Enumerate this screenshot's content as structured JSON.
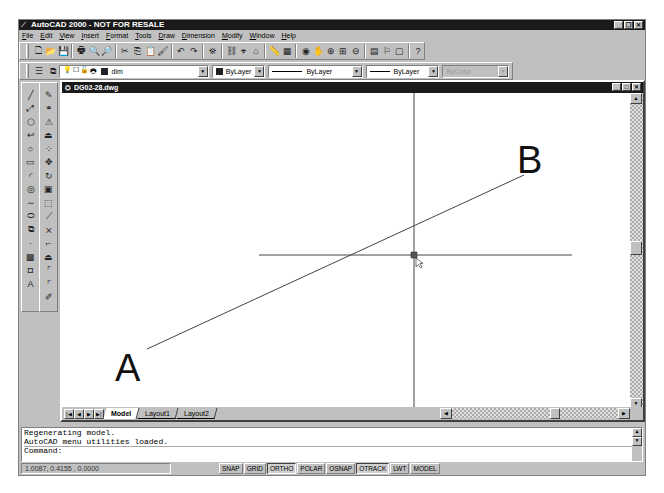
{
  "window": {
    "title": "AutoCAD 2000 - NOT FOR RESALE",
    "controls": [
      "minimize",
      "restore",
      "close"
    ]
  },
  "menubar": {
    "items": [
      "File",
      "Edit",
      "View",
      "Insert",
      "Format",
      "Tools",
      "Draw",
      "Dimension",
      "Modify",
      "Window",
      "Help"
    ]
  },
  "standard_toolbar": {
    "icons": [
      "new-icon",
      "open-icon",
      "save-icon",
      "print-icon",
      "print-preview-icon",
      "find-icon",
      "cut-icon",
      "copy-icon",
      "paste-icon",
      "match-properties-icon",
      "undo-icon",
      "redo-icon",
      "publish-icon",
      "hyperlink-icon",
      "object-snap-icon",
      "ucs-icon",
      "distance-icon",
      "named-views-icon",
      "3d-orbit-icon",
      "pan-icon",
      "zoom-realtime-icon",
      "zoom-window-icon",
      "zoom-previous-icon",
      "properties-icon",
      "design-center-icon",
      "today-icon",
      "help-icon"
    ],
    "glyphs": [
      "🗋",
      "📂",
      "💾",
      "🖶",
      "🔍",
      "🔎",
      "✂",
      "⎘",
      "📋",
      "🖌",
      "↶",
      "↷",
      "⛯",
      "⛓",
      "⌖",
      "⌂",
      "📏",
      "▦",
      "◉",
      "✋",
      "⊕",
      "⊞",
      "⊖",
      "▤",
      "⚐",
      "▢",
      "?"
    ]
  },
  "layers_toolbar": {
    "layer_manager_icon": "layer-manager-icon",
    "make_current_icon": "make-current-icon",
    "layer_state_glyphs": [
      "💡",
      "☐",
      "🔓",
      "🖶"
    ],
    "current_layer": "dim",
    "color": "ByLayer",
    "linetype": "ByLayer",
    "lineweight": "ByLayer",
    "plot_style": "ByColor"
  },
  "draw_toolbar": {
    "icons": [
      "line-icon",
      "construction-line-icon",
      "polyline-icon",
      "polygon-icon",
      "rectangle-icon",
      "arc-icon",
      "circle-icon",
      "spline-icon",
      "ellipse-icon",
      "insert-block-icon",
      "make-block-icon",
      "point-icon",
      "hatch-icon",
      "region-icon",
      "multiline-text-icon"
    ],
    "glyphs": [
      "╱",
      "⤢",
      "⬡",
      "↩",
      "○",
      "▭",
      "◜",
      "◎",
      "∼",
      "⬭",
      "⧉",
      "·",
      "▩",
      "◘",
      "A"
    ]
  },
  "modify_toolbar": {
    "icons": [
      "erase-icon",
      "copy-object-icon",
      "mirror-icon",
      "offset-icon",
      "array-icon",
      "move-icon",
      "rotate-icon",
      "scale-icon",
      "stretch-icon",
      "lengthen-icon",
      "trim-icon",
      "extend-icon",
      "break-icon",
      "chamfer-icon",
      "fillet-icon",
      "explode-icon"
    ],
    "glyphs": [
      "✎",
      "⚭",
      "⚠",
      "⏏",
      "⁘",
      "✥",
      "↻",
      "▣",
      "⬚",
      "⟋",
      "⨯",
      "⌐",
      "⏏",
      "⌜",
      "⌜",
      "✐"
    ]
  },
  "document": {
    "title": "DG02-28.dwg",
    "icon": "drawing-icon",
    "tabs": [
      {
        "label": "Model",
        "active": true
      },
      {
        "label": "Layout1",
        "active": false
      },
      {
        "label": "Layout2",
        "active": false
      }
    ],
    "nav_buttons": [
      "first-tab",
      "prev-tab",
      "next-tab",
      "last-tab"
    ]
  },
  "drawing": {
    "labels": {
      "a": "A",
      "b": "B"
    },
    "line_color": "#333333",
    "cursor": "crosshair-with-pickbox"
  },
  "command_line": {
    "history": [
      "Regenerating model.",
      "AutoCAD menu utilities loaded."
    ],
    "prompt": "Command:"
  },
  "status_bar": {
    "coordinates": "1.0087, 0.4155 , 0.0000",
    "toggles": [
      {
        "label": "SNAP",
        "on": false
      },
      {
        "label": "GRID",
        "on": false
      },
      {
        "label": "ORTHO",
        "on": true
      },
      {
        "label": "POLAR",
        "on": false
      },
      {
        "label": "OSNAP",
        "on": false
      },
      {
        "label": "OTRACK",
        "on": true
      },
      {
        "label": "LWT",
        "on": false
      },
      {
        "label": "MODEL",
        "on": false
      }
    ]
  }
}
